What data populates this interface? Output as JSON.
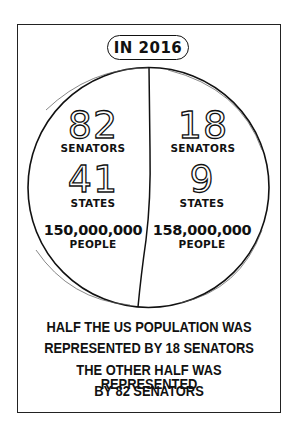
{
  "title": "IN 2016",
  "left_half": {
    "senators_count": "82",
    "senators_label": "SENATORS",
    "states_count": "41",
    "states_label": "STATES",
    "population": "150,000,000",
    "population_label": "PEOPLE"
  },
  "right_half": {
    "senators_count": "18",
    "senators_label": "SENATORS",
    "states_count": "9",
    "states_label": "STATES",
    "population": "158,000,000",
    "population_label": "PEOPLE"
  },
  "captions": [
    "HALF THE US POPULATION WAS",
    "REPRESENTED BY 18 SENATORS",
    "THE OTHER HALF WAS REPRESENTED",
    "BY 82 SENATORS"
  ],
  "colors": {
    "ink": "#111111",
    "background": "#ffffff"
  }
}
